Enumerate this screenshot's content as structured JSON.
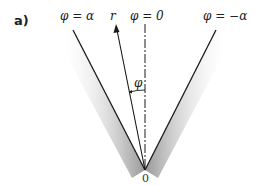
{
  "figure": {
    "panel_label": "a)",
    "labels": {
      "phi_alpha": "φ = α",
      "r": "r",
      "phi_zero": "φ = 0",
      "phi_neg_alpha": "φ = −α",
      "phi": "φ",
      "origin": "0"
    },
    "colors": {
      "line": "#1a1a1a",
      "shade_dark": "#9a9a9a",
      "shade_light": "#ffffff",
      "text": "#222222"
    }
  }
}
